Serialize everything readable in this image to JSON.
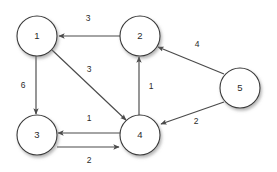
{
  "figure": {
    "type": "directed-weighted-graph",
    "background_color": "#ffffff",
    "node_fill_color": "#ffffff",
    "node_stroke_color": "#3a3a3a",
    "edge_color": "#4a4a4a",
    "text_color": "#2a2a2a"
  },
  "nodes": [
    {
      "id": "1",
      "label": "1",
      "cx": 37,
      "cy": 36,
      "r": 20
    },
    {
      "id": "2",
      "label": "2",
      "cx": 140,
      "cy": 36,
      "r": 20
    },
    {
      "id": "3",
      "label": "3",
      "cx": 37,
      "cy": 135,
      "r": 20
    },
    {
      "id": "4",
      "label": "4",
      "cx": 140,
      "cy": 135,
      "r": 20
    },
    {
      "id": "5",
      "label": "5",
      "cx": 240,
      "cy": 88,
      "r": 20
    }
  ],
  "edges": [
    {
      "id": "e2-1",
      "from": "2",
      "to": "1",
      "weight": "3",
      "directed": true,
      "x1": 120,
      "y1": 36,
      "x2": 59,
      "y2": 36,
      "lx": 88,
      "ly": 19
    },
    {
      "id": "e1-3",
      "from": "1",
      "to": "3",
      "weight": "6",
      "directed": true,
      "x1": 36,
      "y1": 56,
      "x2": 36,
      "y2": 114,
      "lx": 23,
      "ly": 86
    },
    {
      "id": "e1-4",
      "from": "1",
      "to": "4",
      "weight": "3",
      "directed": true,
      "x1": 52,
      "y1": 50,
      "x2": 126,
      "y2": 120,
      "lx": 89,
      "ly": 70
    },
    {
      "id": "e4-2",
      "from": "4",
      "to": "2",
      "weight": "1",
      "directed": true,
      "x1": 139,
      "y1": 115,
      "x2": 139,
      "y2": 57,
      "lx": 151,
      "ly": 87
    },
    {
      "id": "e5-2",
      "from": "5",
      "to": "2",
      "weight": "4",
      "directed": true,
      "x1": 224,
      "y1": 74,
      "x2": 158,
      "y2": 47,
      "lx": 197,
      "ly": 45
    },
    {
      "id": "e5-4",
      "from": "5",
      "to": "4",
      "weight": "2",
      "directed": true,
      "x1": 224,
      "y1": 102,
      "x2": 161,
      "y2": 124,
      "lx": 196,
      "ly": 122
    },
    {
      "id": "e4-3",
      "from": "4",
      "to": "3",
      "weight": "1",
      "directed": true,
      "x1": 120,
      "y1": 133,
      "x2": 58,
      "y2": 133,
      "lx": 89,
      "ly": 119
    },
    {
      "id": "e3-4",
      "from": "3",
      "to": "4",
      "weight": "2",
      "directed": true,
      "x1": 57,
      "y1": 147,
      "x2": 119,
      "y2": 147,
      "lx": 89,
      "ly": 161
    }
  ]
}
